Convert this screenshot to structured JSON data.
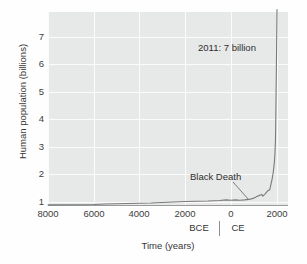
{
  "chart_data": {
    "type": "line",
    "title": "",
    "xlabel": "Time (years)",
    "ylabel": "Human population (billions)",
    "xlim": [
      -8000,
      2500
    ],
    "ylim": [
      0,
      7.6
    ],
    "grid": true,
    "legend": null,
    "x_tick_labels": [
      "8000",
      "6000",
      "4000",
      "2000",
      "0",
      "2000"
    ],
    "x_tick_values": [
      -8000,
      -6000,
      -4000,
      -2000,
      0,
      2000
    ],
    "y_tick_labels": [
      "1",
      "2",
      "3",
      "4",
      "5",
      "6",
      "7"
    ],
    "y_tick_values": [
      1,
      2,
      3,
      4,
      5,
      6,
      7
    ],
    "era_labels": {
      "before": "BCE",
      "after": "CE",
      "divider_at": 0
    },
    "annotations": [
      {
        "name": "peak-label",
        "text": "2011: 7 billion",
        "x": 1050,
        "y": 6.3
      },
      {
        "name": "black-death-label",
        "text": "Black Death",
        "x": 200,
        "y": 1.05
      }
    ],
    "series": [
      {
        "name": "World population",
        "x": [
          -8000,
          -7000,
          -6000,
          -5500,
          -5000,
          -4500,
          -4000,
          -3500,
          -3000,
          -2500,
          -2000,
          -1500,
          -1000,
          -500,
          -200,
          0,
          200,
          400,
          600,
          800,
          1000,
          1200,
          1300,
          1340,
          1400,
          1500,
          1600,
          1700,
          1800,
          1850,
          1900,
          1927,
          1950,
          1960,
          1974,
          1987,
          1999,
          2011,
          2020
        ],
        "y": [
          0.005,
          0.01,
          0.02,
          0.04,
          0.05,
          0.06,
          0.07,
          0.08,
          0.1,
          0.12,
          0.14,
          0.15,
          0.16,
          0.18,
          0.2,
          0.19,
          0.2,
          0.19,
          0.2,
          0.22,
          0.27,
          0.36,
          0.39,
          0.42,
          0.35,
          0.44,
          0.55,
          0.6,
          1.0,
          1.26,
          1.65,
          2.0,
          2.5,
          3.0,
          4.0,
          5.0,
          6.0,
          7.0,
          7.7
        ]
      }
    ],
    "colors": {
      "line": "#7a7a7a",
      "plot_background": "#e7e8e8",
      "gridline": "#fbfbfb",
      "text": "#353535"
    }
  }
}
